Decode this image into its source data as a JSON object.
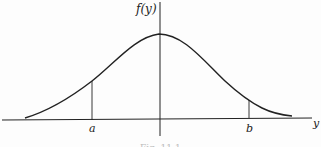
{
  "figure": {
    "type": "normal-density-curve",
    "y_axis_label": "f(y)",
    "x_axis_label": "y",
    "markers": [
      {
        "label": "a",
        "position": "left of mean"
      },
      {
        "label": "b",
        "position": "right of mean"
      }
    ],
    "caption": "Fig. 11.1",
    "colors": {
      "line": "#222222",
      "background": "#fdfdfd"
    }
  }
}
